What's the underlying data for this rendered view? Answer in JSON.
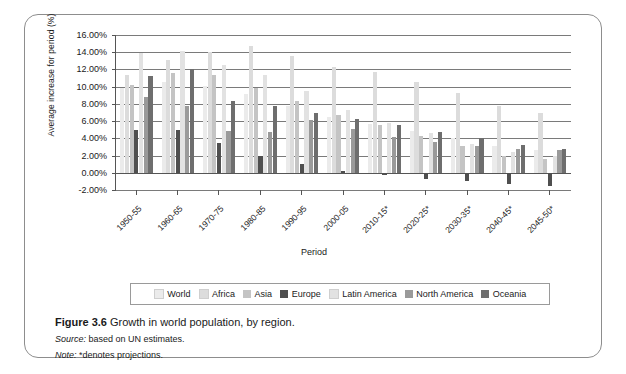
{
  "figure": {
    "number": "Figure 3.6",
    "title": "Growth in world population, by region.",
    "source_label": "Source:",
    "source_text": " based on UN estimates.",
    "note_label": "Note:",
    "note_text": " *denotes projections."
  },
  "axes": {
    "ylabel": "Average increase for period (%)",
    "xlabel": "Period"
  },
  "chart_data": {
    "type": "bar",
    "title": "Growth in world population, by region.",
    "xlabel": "Period",
    "ylabel": "Average increase for period (%)",
    "ylim": [
      -2,
      16
    ],
    "ytick_labels": [
      "16.00%",
      "14.00%",
      "12.00%",
      "10.00%",
      "8.00%",
      "6.00%",
      "4.00%",
      "2.00%",
      "0.00%",
      "-2.00%"
    ],
    "ytick_values": [
      16,
      14,
      12,
      10,
      8,
      6,
      4,
      2,
      0,
      -2
    ],
    "grid": true,
    "legend_position": "bottom",
    "categories": [
      "1950-55",
      "1960-65",
      "1970-75",
      "1980-85",
      "1990-95",
      "2000-05",
      "2010-15*",
      "2020-25*",
      "2030-35*",
      "2040-45*",
      "2045-50*"
    ],
    "categories_displayed": [
      "1950-55",
      "1960-65",
      "1970-75",
      "1980-85",
      "1990-95",
      "2000-05",
      "2010-15*",
      "2020-25*",
      "2030-35*",
      "2040-45*",
      "2045-50*"
    ],
    "series": [
      {
        "name": "World",
        "color": "#ebebeb",
        "values": [
          9.8,
          10.6,
          10.1,
          9.2,
          7.8,
          6.5,
          5.7,
          4.9,
          4.0,
          3.1,
          2.7
        ]
      },
      {
        "name": "Africa",
        "color": "#dcdcdc",
        "values": [
          11.4,
          13.1,
          14.0,
          14.7,
          13.6,
          12.3,
          11.7,
          10.6,
          9.3,
          7.8,
          7.0
        ]
      },
      {
        "name": "Asia",
        "color": "#c4c4c4",
        "values": [
          10.2,
          11.6,
          11.3,
          9.9,
          8.3,
          6.7,
          5.5,
          4.3,
          3.1,
          2.0,
          1.6
        ]
      },
      {
        "name": "Europe",
        "color": "#4f4f4f",
        "values": [
          5.0,
          5.0,
          3.5,
          1.9,
          1.0,
          0.2,
          -0.3,
          -0.7,
          -1.0,
          -1.3,
          -1.5
        ]
      },
      {
        "name": "Latin America",
        "color": "#e2e2e2",
        "values": [
          13.9,
          14.2,
          12.5,
          11.3,
          9.5,
          7.3,
          5.8,
          4.6,
          3.4,
          2.4,
          2.0
        ]
      },
      {
        "name": "North America",
        "color": "#9a9a9a",
        "values": [
          8.8,
          7.7,
          4.9,
          4.7,
          6.1,
          5.1,
          4.2,
          3.6,
          3.1,
          2.8,
          2.6
        ]
      },
      {
        "name": "Oceania",
        "color": "#6e6e6e",
        "values": [
          11.2,
          12.1,
          8.3,
          7.8,
          7.0,
          6.2,
          5.5,
          4.7,
          4.0,
          3.2,
          2.8
        ]
      }
    ]
  }
}
